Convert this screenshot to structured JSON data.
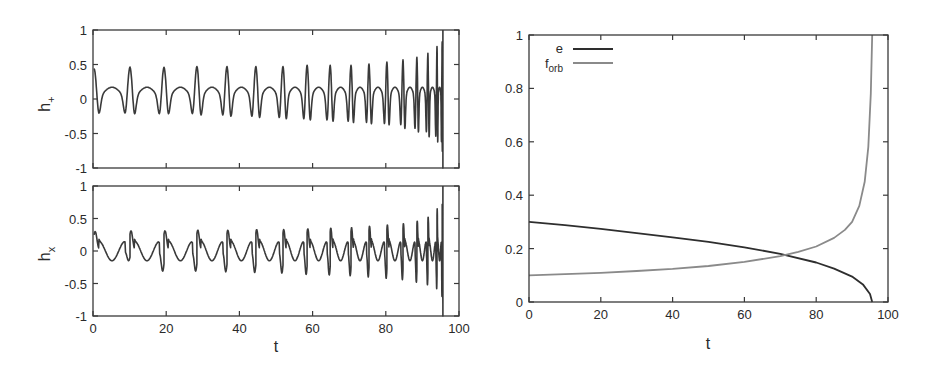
{
  "chart_data": [
    {
      "id": "h_plus",
      "type": "line",
      "title": "",
      "xlabel": "t",
      "ylabel": "h+",
      "ylabel_main": "h",
      "ylabel_sub": "+",
      "xlim": [
        0,
        100
      ],
      "ylim": [
        -1,
        1
      ],
      "xticks": [
        0,
        20,
        40,
        60,
        80,
        100
      ],
      "yticks": [
        -1,
        -0.5,
        0,
        0.5,
        1
      ],
      "ytick_labels": [
        "-1",
        "-0.5",
        "0",
        "0.5",
        "1"
      ],
      "show_xtick_labels": false,
      "grid": false,
      "series": [
        {
          "name": "h+",
          "color": "#3a3a3a",
          "description": "eccentric inspiral waveform; sharp periastron peaks with growing amplitude and frequency, merging near t≈95.5",
          "peak_times": [
            0.3,
            10.1,
            19.4,
            28.4,
            36.6,
            44.5,
            51.9,
            58.5,
            64.8,
            70.5,
            75.4,
            80.3,
            84.7,
            88.5,
            91.5,
            94.0,
            95.4
          ],
          "peak_values": [
            0.45,
            0.47,
            0.47,
            0.48,
            0.48,
            0.48,
            0.48,
            0.5,
            0.5,
            0.5,
            0.52,
            0.55,
            0.58,
            0.62,
            0.68,
            0.78,
            0.85
          ],
          "trough_values": [
            -0.27,
            -0.28,
            -0.28,
            -0.3,
            -0.32,
            -0.34,
            -0.36,
            -0.38,
            -0.4,
            -0.42,
            -0.44,
            -0.46,
            -0.52,
            -0.58,
            -0.66,
            -0.75,
            -0.9
          ],
          "end_t": 95.6
        }
      ]
    },
    {
      "id": "h_cross",
      "type": "line",
      "title": "",
      "xlabel": "t",
      "ylabel": "hx",
      "ylabel_main": "h",
      "ylabel_sub": "x",
      "xlim": [
        0,
        100
      ],
      "ylim": [
        -1,
        1
      ],
      "xticks": [
        0,
        20,
        40,
        60,
        80,
        100
      ],
      "xtick_labels": [
        "0",
        "20",
        "40",
        "60",
        "80",
        "100"
      ],
      "yticks": [
        -1,
        -0.5,
        0,
        0.5,
        1
      ],
      "ytick_labels": [
        "-1",
        "-0.5",
        "0",
        "0.5",
        "1"
      ],
      "show_xtick_labels": true,
      "grid": false,
      "series": [
        {
          "name": "hx",
          "color": "#3a3a3a",
          "description": "cross polarization of eccentric inspiral; bipolar periastron bursts, amplitude growing to ±0.9 near t≈95.5",
          "peak_times": [
            0.3,
            10.1,
            19.4,
            28.4,
            36.6,
            44.5,
            51.9,
            58.5,
            64.8,
            70.5,
            75.4,
            80.3,
            84.7,
            88.5,
            91.5,
            94.0,
            95.4
          ],
          "peak_values": [
            0.3,
            0.31,
            0.31,
            0.32,
            0.32,
            0.33,
            0.33,
            0.34,
            0.35,
            0.36,
            0.38,
            0.4,
            0.42,
            0.46,
            0.52,
            0.65,
            0.72
          ],
          "trough_values": [
            -0.15,
            -0.31,
            -0.31,
            -0.32,
            -0.33,
            -0.34,
            -0.36,
            -0.37,
            -0.38,
            -0.4,
            -0.42,
            -0.44,
            -0.48,
            -0.52,
            -0.58,
            -0.7,
            -0.95
          ],
          "end_t": 95.6
        }
      ]
    },
    {
      "id": "orbit_params",
      "type": "line",
      "title": "",
      "xlabel": "t",
      "ylabel": "",
      "xlim": [
        0,
        100
      ],
      "ylim": [
        0,
        1
      ],
      "xticks": [
        0,
        20,
        40,
        60,
        80,
        100
      ],
      "xtick_labels": [
        "0",
        "20",
        "40",
        "60",
        "80",
        "100"
      ],
      "yticks": [
        0,
        0.2,
        0.4,
        0.6,
        0.8,
        1
      ],
      "ytick_labels": [
        "0",
        "0.2",
        "0.4",
        "0.6",
        "0.8",
        "1"
      ],
      "grid": false,
      "legend_position": "upper left",
      "annotations": [
        {
          "text": "curves cross",
          "t": 71,
          "value": 0.175
        }
      ],
      "series": [
        {
          "name": "e",
          "label_main": "e",
          "label_sub": "",
          "color": "#2e2e2e",
          "x": [
            0,
            10,
            20,
            30,
            40,
            50,
            60,
            70,
            80,
            85,
            90,
            93,
            95,
            95.6
          ],
          "y": [
            0.3,
            0.288,
            0.274,
            0.258,
            0.242,
            0.225,
            0.205,
            0.18,
            0.148,
            0.125,
            0.095,
            0.066,
            0.03,
            0.0
          ]
        },
        {
          "name": "f_orb",
          "label_main": "f",
          "label_sub": "orb",
          "color": "#8a8a8a",
          "x": [
            0,
            10,
            20,
            30,
            40,
            50,
            60,
            70,
            75,
            80,
            85,
            88,
            90,
            92,
            93.5,
            94.5,
            95.2,
            95.6
          ],
          "y": [
            0.1,
            0.104,
            0.109,
            0.116,
            0.124,
            0.135,
            0.15,
            0.172,
            0.188,
            0.208,
            0.24,
            0.27,
            0.3,
            0.36,
            0.45,
            0.58,
            0.78,
            1.0
          ]
        }
      ]
    }
  ]
}
